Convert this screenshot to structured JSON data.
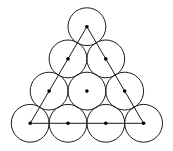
{
  "diagram": {
    "type": "triangular-circle-packing",
    "rows": 4,
    "total_circles": 10,
    "radius": 18.9,
    "stroke_color": "#1a1a1a",
    "dot_color": "#000000",
    "background": "#ffffff",
    "centers": [
      {
        "row": 0,
        "x": 86.9,
        "y": 26.7
      },
      {
        "row": 1,
        "x": 68.0,
        "y": 58.9
      },
      {
        "row": 1,
        "x": 105.8,
        "y": 58.9
      },
      {
        "row": 2,
        "x": 49.1,
        "y": 91.1
      },
      {
        "row": 2,
        "x": 86.9,
        "y": 91.1
      },
      {
        "row": 2,
        "x": 124.7,
        "y": 91.1
      },
      {
        "row": 3,
        "x": 30.2,
        "y": 123.3
      },
      {
        "row": 3,
        "x": 68.0,
        "y": 123.3
      },
      {
        "row": 3,
        "x": 105.8,
        "y": 123.3
      },
      {
        "row": 3,
        "x": 143.6,
        "y": 123.3
      }
    ],
    "triangle": {
      "vertices": [
        {
          "x": 86.9,
          "y": 26.7
        },
        {
          "x": 30.2,
          "y": 123.3
        },
        {
          "x": 143.6,
          "y": 123.3
        }
      ]
    }
  }
}
